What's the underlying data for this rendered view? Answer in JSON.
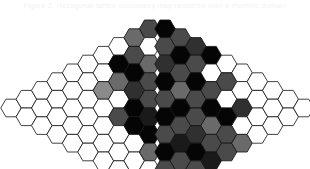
{
  "caption": {
    "text": "Figure 2.  Hexagonal lattice occupancy map rendered over a rhombic domain"
  },
  "figure": {
    "background_color": "#ffffff",
    "stroke_color": "#111111",
    "stroke_width": 0.8,
    "hex_orientation": "flat-top",
    "hex_width": 20.5,
    "hex_height": 17.6,
    "column_step": 15.4,
    "row_step": 17.6,
    "origin_x": 11.0,
    "origin_y": 9.0,
    "columns": 20,
    "shape": "rhombus",
    "palette": {
      "0": "#ffffff",
      "1": "#b8b8b8",
      "2": "#8a8a8a",
      "3": "#6a6a6a",
      "4": "#4a4a4a",
      "5": "#303030",
      "6": "#1a1a1a",
      "7": "#050505"
    },
    "legend_labels": [
      "empty",
      "very low",
      "low",
      "medium low",
      "medium",
      "medium high",
      "high",
      "saturated"
    ]
  },
  "chart_data": {
    "type": "heatmap",
    "title": "Hexagonal lattice occupancy map",
    "xlabel": "",
    "ylabel": "",
    "grid": true,
    "legend_position": "none",
    "value_range": [
      0,
      7
    ],
    "columns_counts": [
      1,
      2,
      3,
      4,
      5,
      6,
      7,
      8,
      9,
      10,
      10,
      9,
      8,
      7,
      6,
      5,
      4,
      3,
      2,
      1
    ],
    "columns": [
      {
        "index": 0,
        "count": 1,
        "values": [
          0
        ]
      },
      {
        "index": 1,
        "count": 2,
        "values": [
          0,
          0
        ]
      },
      {
        "index": 2,
        "count": 3,
        "values": [
          0,
          0,
          0
        ]
      },
      {
        "index": 3,
        "count": 4,
        "values": [
          0,
          0,
          0,
          0
        ]
      },
      {
        "index": 4,
        "count": 5,
        "values": [
          0,
          0,
          0,
          0,
          0
        ]
      },
      {
        "index": 5,
        "count": 6,
        "values": [
          0,
          0,
          0,
          0,
          0,
          0
        ]
      },
      {
        "index": 6,
        "count": 7,
        "values": [
          0,
          0,
          2,
          0,
          0,
          0,
          0
        ]
      },
      {
        "index": 7,
        "count": 8,
        "values": [
          0,
          7,
          3,
          0,
          4,
          0,
          0,
          0
        ]
      },
      {
        "index": 8,
        "count": 9,
        "values": [
          3,
          4,
          7,
          5,
          7,
          7,
          0,
          0,
          0
        ]
      },
      {
        "index": 9,
        "count": 10,
        "values": [
          4,
          0,
          3,
          4,
          4,
          6,
          7,
          3,
          0,
          0
        ]
      },
      {
        "index": 10,
        "count": 10,
        "values": [
          7,
          4,
          5,
          7,
          4,
          7,
          4,
          7,
          4,
          0
        ]
      },
      {
        "index": 11,
        "count": 9,
        "values": [
          4,
          7,
          4,
          3,
          7,
          4,
          6,
          4,
          3
        ]
      },
      {
        "index": 12,
        "count": 8,
        "values": [
          5,
          4,
          7,
          4,
          4,
          5,
          7,
          4
        ]
      },
      {
        "index": 13,
        "count": 7,
        "values": [
          7,
          0,
          4,
          7,
          3,
          4,
          6
        ]
      },
      {
        "index": 14,
        "count": 6,
        "values": [
          0,
          4,
          0,
          7,
          4,
          4
        ]
      },
      {
        "index": 15,
        "count": 5,
        "values": [
          0,
          0,
          5,
          0,
          3
        ]
      },
      {
        "index": 16,
        "count": 4,
        "values": [
          0,
          0,
          0,
          0
        ]
      },
      {
        "index": 17,
        "count": 3,
        "values": [
          0,
          0,
          0
        ]
      },
      {
        "index": 18,
        "count": 2,
        "values": [
          0,
          0
        ]
      },
      {
        "index": 19,
        "count": 1,
        "values": [
          0
        ]
      }
    ]
  }
}
